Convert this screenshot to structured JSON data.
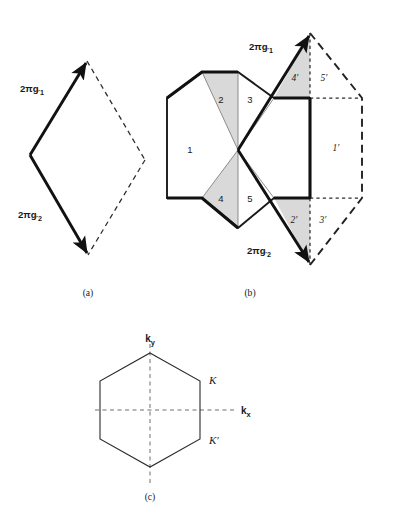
{
  "figure": {
    "background_color": "#ffffff",
    "shade_color": "#d9d9d9",
    "line_color": "#1a1a1a"
  },
  "panel_a": {
    "caption": "(a)",
    "vector_1_label": "2πg",
    "vector_1_sub": "1",
    "vector_2_label": "2πg",
    "vector_2_sub": "2",
    "shape": "rhombus",
    "solid_edges": 2,
    "dashed_edges": 2
  },
  "panel_b": {
    "caption": "(b)",
    "vector_1_label": "2πg",
    "vector_1_sub": "1",
    "vector_2_label": "2πg",
    "vector_2_sub": "2",
    "hexagon_regions": [
      {
        "id": "r1",
        "label": "1",
        "shaded": false
      },
      {
        "id": "r2",
        "label": "2",
        "shaded": true
      },
      {
        "id": "r3",
        "label": "3",
        "shaded": false
      },
      {
        "id": "r4",
        "label": "4",
        "shaded": true
      },
      {
        "id": "r5",
        "label": "5",
        "shaded": false
      }
    ],
    "rhombus_regions": [
      {
        "id": "r1p",
        "label": "1′",
        "shaded": false
      },
      {
        "id": "r2p",
        "label": "2′",
        "shaded": true
      },
      {
        "id": "r3p",
        "label": "3′",
        "shaded": false
      },
      {
        "id": "r4p",
        "label": "4′",
        "shaded": true
      },
      {
        "id": "r5p",
        "label": "5′",
        "shaded": false
      }
    ]
  },
  "panel_c": {
    "caption": "(c)",
    "axis_y_label": "k",
    "axis_y_sub": "y",
    "axis_x_label": "k",
    "axis_x_sub": "x",
    "point_k": "K",
    "point_k_prime": "K′",
    "shape": "hexagon",
    "axes": "dashed"
  }
}
